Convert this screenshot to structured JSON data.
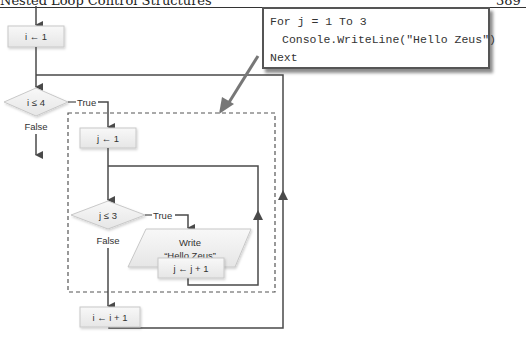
{
  "header": {
    "title": "Nested Loop Control Structures",
    "page_number": "389"
  },
  "callout": {
    "code_lines": [
      "For j = 1 To 3",
      "Console.WriteLine(\"Hello Zeus\")",
      "Next"
    ]
  },
  "flowchart": {
    "nodes": {
      "init_i": "i ← 1",
      "cond_i": "i ≤ 4",
      "init_j": "j ← 1",
      "cond_j": "j ≤ 3",
      "write_line1": "Write",
      "write_line2": "“Hello Zeus”",
      "inc_j": "j ← j + 1",
      "inc_i": "i ← i + 1"
    },
    "edge_labels": {
      "cond_i_true": "True",
      "cond_i_false": "False",
      "cond_j_true": "True",
      "cond_j_false": "False"
    },
    "colors": {
      "line": "#4a4a4a",
      "node_fill": "#f2f2f2",
      "node_stroke": "#c8c8c8",
      "dashed_border": "#555555"
    }
  }
}
